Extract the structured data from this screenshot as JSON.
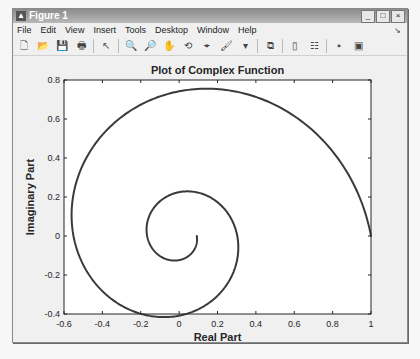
{
  "window": {
    "title": "Figure 1",
    "controls": {
      "minimize": "_",
      "maximize": "□",
      "close": "×"
    }
  },
  "menubar": {
    "items": [
      "File",
      "Edit",
      "View",
      "Insert",
      "Tools",
      "Desktop",
      "Window",
      "Help"
    ],
    "dock_arrow": "↘"
  },
  "toolbar": {
    "buttons": [
      {
        "name": "new-figure",
        "glyph": "🗋"
      },
      {
        "name": "open-file",
        "glyph": "📂"
      },
      {
        "name": "save-figure",
        "glyph": "💾"
      },
      {
        "name": "print-figure",
        "glyph": "🖶"
      },
      {
        "sep": true
      },
      {
        "name": "edit-plot",
        "glyph": "↖"
      },
      {
        "sep": true
      },
      {
        "name": "zoom-in",
        "glyph": "🔍"
      },
      {
        "name": "zoom-out",
        "glyph": "🔎"
      },
      {
        "name": "pan",
        "glyph": "✋"
      },
      {
        "name": "rotate-3d",
        "glyph": "⟲"
      },
      {
        "name": "data-cursor",
        "glyph": "⌖"
      },
      {
        "name": "brush",
        "glyph": "🖌"
      },
      {
        "name": "brush-dropdown",
        "glyph": "▾"
      },
      {
        "sep": true
      },
      {
        "name": "link-plot",
        "glyph": "⧉"
      },
      {
        "sep": true
      },
      {
        "name": "insert-colorbar",
        "glyph": "▯"
      },
      {
        "name": "insert-legend",
        "glyph": "☷"
      },
      {
        "sep": true
      },
      {
        "name": "hide-plot-tools",
        "glyph": "▪"
      },
      {
        "name": "show-plot-tools",
        "glyph": "▣"
      }
    ]
  },
  "chart_data": {
    "type": "line",
    "title": "Plot of Complex Function",
    "xlabel": "Real Part",
    "ylabel": "Imaginary Part",
    "xlim": [
      -0.6,
      1
    ],
    "ylim": [
      -0.4,
      0.8
    ],
    "xticks": [
      -0.6,
      -0.4,
      -0.2,
      0,
      0.2,
      0.4,
      0.6,
      0.8,
      1
    ],
    "xtick_labels": [
      "-0.6",
      "-0.4",
      "-0.2",
      "0",
      "0.2",
      "0.4",
      "0.6",
      "0.8",
      "1"
    ],
    "yticks": [
      -0.4,
      -0.2,
      0,
      0.2,
      0.4,
      0.6,
      0.8
    ],
    "ytick_labels": [
      "-0.4",
      "-0.2",
      "0",
      "0.2",
      "0.4",
      "0.6",
      "0.8"
    ],
    "grid": false,
    "legend": null,
    "series": [
      {
        "name": "z(t) = exp((-0.19 + i)t), t in [0, 4π]",
        "color": "#3a3a3a",
        "line_width": 2,
        "x": [
          1.0,
          0.72,
          0.36,
          0.1,
          -0.14,
          -0.34,
          -0.47,
          -0.54,
          -0.55,
          -0.5,
          -0.4,
          -0.26,
          -0.1,
          0.05,
          0.17,
          0.26,
          0.3,
          0.29,
          0.23,
          0.14,
          0.03,
          -0.07,
          -0.14,
          -0.165,
          -0.15,
          -0.1,
          -0.04,
          0.02,
          0.07,
          0.09,
          0.09,
          0.08
        ],
        "y": [
          0.0,
          0.37,
          0.62,
          0.74,
          0.73,
          0.61,
          0.42,
          0.2,
          -0.02,
          -0.22,
          -0.36,
          -0.4,
          -0.39,
          -0.33,
          -0.22,
          -0.1,
          0.02,
          0.13,
          0.2,
          0.22,
          0.2,
          0.14,
          0.07,
          0.0,
          -0.06,
          -0.1,
          -0.11,
          -0.1,
          -0.07,
          -0.03,
          0.0,
          0.0
        ],
        "param": {
          "decay": 0.19,
          "t_max": 12.566
        }
      }
    ]
  }
}
